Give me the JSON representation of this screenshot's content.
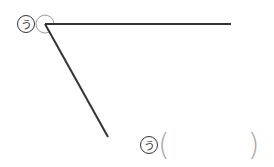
{
  "diagram": {
    "type": "angle",
    "vertex": [
      45,
      24
    ],
    "ray_horizontal_end": [
      231,
      24
    ],
    "ray_slant_end": [
      108,
      137
    ],
    "line_color": "#333333",
    "arc_color": "#999999",
    "angle_label": "う"
  },
  "answer": {
    "label": "う",
    "value": ""
  }
}
